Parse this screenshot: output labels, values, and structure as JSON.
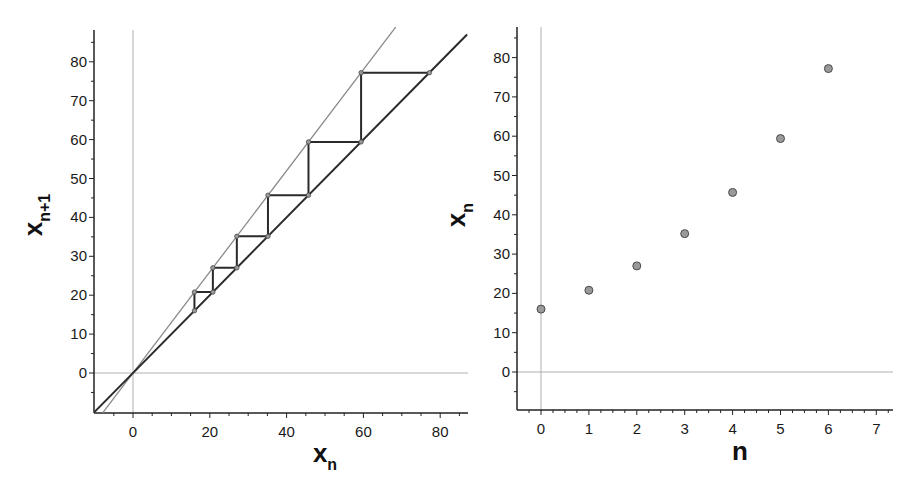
{
  "chart_data": [
    {
      "id": "cobweb",
      "type": "line",
      "title": "",
      "xlabel": {
        "main": "x",
        "sub": "n"
      },
      "ylabel": {
        "main": "x",
        "sub": "n+1"
      },
      "xlim": [
        -10,
        87
      ],
      "ylim": [
        -10,
        88
      ],
      "x_ticks": [
        0,
        20,
        40,
        60,
        80
      ],
      "y_ticks": [
        0,
        10,
        20,
        30,
        40,
        50,
        60,
        70,
        80
      ],
      "minor_tick_step": 5,
      "grid": false,
      "reference_lines": {
        "x0": true,
        "y0": true
      },
      "series": [
        {
          "name": "f(x) = 1.3x",
          "style": "thin-gray",
          "slope": 1.3,
          "x_range": [
            -7.9,
            68.4
          ]
        },
        {
          "name": "y = x",
          "style": "thick-dark",
          "slope": 1.0,
          "x_range": [
            -10,
            87
          ]
        },
        {
          "name": "cobweb",
          "style": "thick-dark",
          "iterates": [
            16,
            20.8,
            27.04,
            35.15,
            45.7,
            59.4,
            77.2
          ]
        }
      ]
    },
    {
      "id": "sequence",
      "type": "scatter",
      "title": "",
      "xlabel": {
        "main": "n",
        "sub": ""
      },
      "ylabel": {
        "main": "x",
        "sub": "n"
      },
      "xlim": [
        -0.5,
        7.4
      ],
      "ylim": [
        -10,
        88
      ],
      "x_ticks": [
        0,
        1,
        2,
        3,
        4,
        5,
        6,
        7
      ],
      "y_ticks": [
        0,
        10,
        20,
        30,
        40,
        50,
        60,
        70,
        80
      ],
      "grid": false,
      "reference_lines": {
        "x0": true,
        "y0": true
      },
      "series": [
        {
          "name": "x_n",
          "x": [
            0,
            1,
            2,
            3,
            4,
            5,
            6
          ],
          "values": [
            16,
            20.8,
            27.0,
            35.2,
            45.7,
            59.4,
            77.2
          ]
        }
      ]
    }
  ],
  "colors": {
    "axis": "#222222",
    "thin_line": "#8a8a8a",
    "thick_line": "#2a2a2a",
    "ref_line": "#b0b0b0",
    "marker_fill": "#9a9a9a",
    "marker_stroke": "#4a4a4a"
  }
}
